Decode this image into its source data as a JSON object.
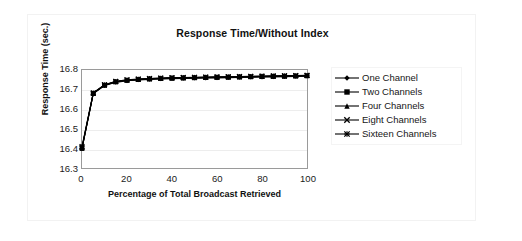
{
  "chart_data": {
    "type": "line",
    "title": "Response Time/Without Index",
    "xlabel": "Percentage of Total Broadcast Retrieved",
    "ylabel": "Response Time (sec.)",
    "xlim": [
      0,
      100
    ],
    "ylim": [
      16.3,
      16.8
    ],
    "xticks": [
      "0",
      "20",
      "40",
      "60",
      "80",
      "100"
    ],
    "xtick_values": [
      0,
      20,
      40,
      60,
      80,
      100
    ],
    "yticks": [
      "16.3",
      "16.4",
      "16.5",
      "16.6",
      "16.7",
      "16.8"
    ],
    "ytick_values": [
      16.3,
      16.4,
      16.5,
      16.6,
      16.7,
      16.8
    ],
    "grid": "horizontal",
    "legend_position": "right",
    "x": [
      0,
      5,
      10,
      15,
      20,
      25,
      30,
      35,
      40,
      45,
      50,
      55,
      60,
      65,
      70,
      75,
      80,
      85,
      90,
      95,
      100
    ],
    "series": [
      {
        "name": "One Channel",
        "marker": "diamond",
        "color": "#000000",
        "values": [
          16.4,
          16.68,
          16.72,
          16.737,
          16.745,
          16.749,
          16.752,
          16.754,
          16.756,
          16.757,
          16.758,
          16.759,
          16.76,
          16.761,
          16.762,
          16.763,
          16.764,
          16.765,
          16.766,
          16.767,
          16.768
        ]
      },
      {
        "name": "Two Channels",
        "marker": "square",
        "color": "#000000",
        "values": [
          16.4,
          16.68,
          16.722,
          16.739,
          16.747,
          16.751,
          16.754,
          16.756,
          16.758,
          16.759,
          16.76,
          16.761,
          16.762,
          16.763,
          16.764,
          16.765,
          16.766,
          16.767,
          16.768,
          16.769,
          16.77
        ]
      },
      {
        "name": "Four Channels",
        "marker": "triangle",
        "color": "#000000",
        "values": [
          16.4,
          16.681,
          16.723,
          16.74,
          16.748,
          16.752,
          16.755,
          16.757,
          16.759,
          16.76,
          16.761,
          16.762,
          16.763,
          16.764,
          16.765,
          16.766,
          16.767,
          16.768,
          16.769,
          16.77,
          16.771
        ]
      },
      {
        "name": "Eight Channels",
        "marker": "cross",
        "color": "#000000",
        "values": [
          16.405,
          16.682,
          16.724,
          16.741,
          16.749,
          16.753,
          16.756,
          16.758,
          16.76,
          16.761,
          16.762,
          16.763,
          16.764,
          16.765,
          16.766,
          16.767,
          16.768,
          16.769,
          16.77,
          16.771,
          16.772
        ]
      },
      {
        "name": "Sixteen Channels",
        "marker": "asterisk",
        "color": "#000000",
        "values": [
          16.41,
          16.683,
          16.725,
          16.742,
          16.75,
          16.754,
          16.757,
          16.759,
          16.761,
          16.762,
          16.763,
          16.764,
          16.765,
          16.766,
          16.767,
          16.768,
          16.769,
          16.77,
          16.771,
          16.772,
          16.773
        ]
      }
    ]
  }
}
